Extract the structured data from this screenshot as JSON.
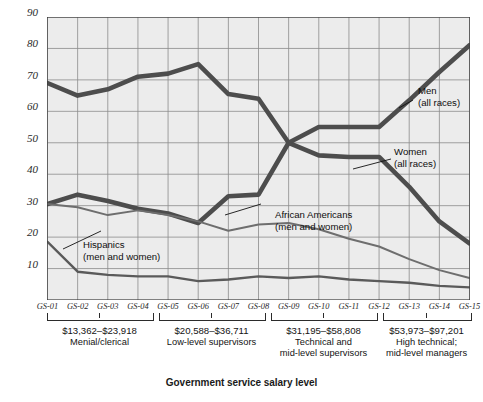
{
  "chart_data": {
    "type": "line",
    "title": "",
    "xlabel": "Government service salary level",
    "ylabel": "Percentage of government employees",
    "ylim": [
      0,
      90
    ],
    "yticks": [
      10,
      20,
      30,
      40,
      50,
      60,
      70,
      80,
      90
    ],
    "grid": true,
    "legend_position": "inline-annotations",
    "categories": [
      "GS-01",
      "GS-02",
      "GS-03",
      "GS-04",
      "GS-05",
      "GS-06",
      "GS-07",
      "GS-08",
      "GS-09",
      "GS-10",
      "GS-11",
      "GS-12",
      "GS-13",
      "GS-14",
      "GS-15"
    ],
    "series": [
      {
        "name": "Women (all races)",
        "label_line1": "Women",
        "label_line2": "(all races)",
        "color": "#4d4d4d",
        "width": 4.6,
        "values": [
          69,
          65,
          67,
          71,
          72,
          75,
          65.5,
          64,
          50,
          46,
          45.5,
          45.5,
          36,
          25,
          18
        ]
      },
      {
        "name": "Men (all races)",
        "label_line1": "Men",
        "label_line2": "(all races)",
        "color": "#4d4d4d",
        "width": 4.6,
        "values": [
          30.5,
          33.5,
          31.5,
          29,
          27.5,
          24.5,
          33,
          33.5,
          50,
          55,
          55,
          55,
          63.5,
          72.5,
          81
        ]
      },
      {
        "name": "African Americans (men and women)",
        "label_line1": "African Americans",
        "label_line2": "(men and women)",
        "color": "#6e6e6e",
        "width": 2.0,
        "values": [
          30.5,
          29.5,
          27,
          28.5,
          27,
          25,
          22,
          24,
          24.5,
          22.5,
          19.5,
          17,
          13,
          9.5,
          7
        ]
      },
      {
        "name": "Hispanics (men and women)",
        "label_line1": "Hispanics",
        "label_line2": "(men and women)",
        "color": "#5a5a5a",
        "width": 2.4,
        "values": [
          18.5,
          9,
          8,
          7.5,
          7.5,
          6,
          6.5,
          7.5,
          7,
          7.5,
          6.5,
          6,
          5.5,
          4.5,
          4
        ]
      }
    ],
    "groups": [
      {
        "range": "$13,362–$23,918",
        "desc_line1": "Menial/clerical",
        "desc_line2": "",
        "from": "GS-01",
        "to": "GS-04"
      },
      {
        "range": "$20,588–$36,711",
        "desc_line1": "Low-level supervisors",
        "desc_line2": "",
        "from": "GS-05",
        "to": "GS-08"
      },
      {
        "range": "$31,195–$58,808",
        "desc_line1": "Technical and",
        "desc_line2": "mid-level supervisors",
        "from": "GS-09",
        "to": "GS-12"
      },
      {
        "range": "$53,973–$97,201",
        "desc_line1": "High technical;",
        "desc_line2": "mid-level managers",
        "from": "GS-13",
        "to": "GS-15"
      }
    ]
  },
  "axis": {
    "y_title": "Percentage of government employees",
    "x_title": "Government service salary level",
    "y_ticks": [
      "90",
      "80",
      "70",
      "60",
      "50",
      "40",
      "30",
      "20",
      "10"
    ],
    "x_ticks": [
      "GS-01",
      "GS-02",
      "GS-03",
      "GS-04",
      "GS-05",
      "GS-06",
      "GS-07",
      "GS-08",
      "GS-09",
      "GS-10",
      "GS-11",
      "GS-12",
      "GS-13",
      "GS-14",
      "GS-15"
    ]
  },
  "annotations": {
    "men": {
      "line1": "Men",
      "line2": "(all races)"
    },
    "women": {
      "line1": "Women",
      "line2": "(all races)"
    },
    "african_americans": {
      "line1": "African Americans",
      "line2": "(men and women)"
    },
    "hispanics": {
      "line1": "Hispanics",
      "line2": "(men and women)"
    }
  },
  "groups_text": {
    "g1": {
      "money": "$13,362–$23,918",
      "l1": "Menial/clerical",
      "l2": ""
    },
    "g2": {
      "money": "$20,588–$36,711",
      "l1": "Low-level supervisors",
      "l2": ""
    },
    "g3": {
      "money": "$31,195–$58,808",
      "l1": "Technical and",
      "l2": "mid-level supervisors"
    },
    "g4": {
      "money": "$53,973–$97,201",
      "l1": "High technical;",
      "l2": "mid-level managers"
    }
  },
  "colors": {
    "plot_bg": "#ececec",
    "grid": "#8c8c8c",
    "axis": "#3a3a3a",
    "thick_line": "#4d4d4d",
    "thin_line": "#6e6e6e"
  }
}
